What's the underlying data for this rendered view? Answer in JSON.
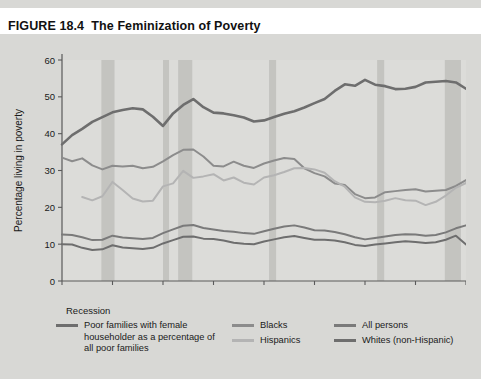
{
  "figure": {
    "number": "FIGURE 18.4",
    "title": "The Feminization of Poverty"
  },
  "legend": {
    "recession_label": "Recession",
    "entries": [
      {
        "label": "Poor families with female householder as a percentage of all poor families",
        "color": "#6e6e6e",
        "column": 1
      },
      {
        "label": "Blacks",
        "color": "#8c8c8c",
        "column": 2
      },
      {
        "label": "Hispanics",
        "color": "#b4b4b4",
        "column": 2
      },
      {
        "label": "All persons",
        "color": "#7a7a7a",
        "column": 3
      },
      {
        "label": "Whites (non-Hispanic)",
        "color": "#6e6e6e",
        "column": 3
      }
    ]
  },
  "chart_data": {
    "type": "line",
    "title": "The Feminization of Poverty",
    "xlabel": "Year",
    "ylabel": "Percentage living in poverty",
    "xlim": [
      1970,
      2010
    ],
    "ylim": [
      0,
      60
    ],
    "xticks": [
      1970,
      1975,
      1980,
      1985,
      1990,
      1995,
      2000,
      2005,
      2010
    ],
    "yticks": [
      0,
      10,
      20,
      30,
      40,
      50,
      60
    ],
    "grid": false,
    "legend_position": "below",
    "recession_bands": [
      {
        "start": 1973.9,
        "end": 1975.2
      },
      {
        "start": 1980.0,
        "end": 1980.6
      },
      {
        "start": 1981.5,
        "end": 1982.9
      },
      {
        "start": 1990.5,
        "end": 1991.2
      },
      {
        "start": 2001.2,
        "end": 2001.9
      },
      {
        "start": 2007.9,
        "end": 2009.5
      }
    ],
    "series": [
      {
        "name": "Poor families with female householder as a percentage of all poor families",
        "color": "#6e6e6e",
        "width": 2.6,
        "x": [
          1970,
          1971,
          1972,
          1973,
          1974,
          1975,
          1976,
          1977,
          1978,
          1979,
          1980,
          1981,
          1982,
          1983,
          1984,
          1985,
          1986,
          1987,
          1988,
          1989,
          1990,
          1991,
          1992,
          1993,
          1994,
          1995,
          1996,
          1997,
          1998,
          1999,
          2000,
          2001,
          2002,
          2003,
          2004,
          2005,
          2006,
          2007,
          2008,
          2009,
          2010
        ],
        "y": [
          37.1,
          39.6,
          41.3,
          43.2,
          44.5,
          45.8,
          46.4,
          46.9,
          46.6,
          44.6,
          42.1,
          45.5,
          47.8,
          49.4,
          47.2,
          45.7,
          45.5,
          45.0,
          44.4,
          43.3,
          43.6,
          44.5,
          45.4,
          46.1,
          47.1,
          48.3,
          49.4,
          51.6,
          53.4,
          53.0,
          54.6,
          53.3,
          52.9,
          52.1,
          52.2,
          52.7,
          53.9,
          54.1,
          54.3,
          53.9,
          52.2
        ]
      },
      {
        "name": "Blacks",
        "color": "#8c8c8c",
        "width": 2.0,
        "x": [
          1970,
          1971,
          1972,
          1973,
          1974,
          1975,
          1976,
          1977,
          1978,
          1979,
          1980,
          1981,
          1982,
          1983,
          1984,
          1985,
          1986,
          1987,
          1988,
          1989,
          1990,
          1991,
          1992,
          1993,
          1994,
          1995,
          1996,
          1997,
          1998,
          1999,
          2000,
          2001,
          2002,
          2003,
          2004,
          2005,
          2006,
          2007,
          2008,
          2009,
          2010
        ],
        "y": [
          33.5,
          32.5,
          33.3,
          31.4,
          30.3,
          31.3,
          31.1,
          31.3,
          30.6,
          31.0,
          32.5,
          34.2,
          35.6,
          35.7,
          33.8,
          31.3,
          31.1,
          32.4,
          31.3,
          30.7,
          31.9,
          32.7,
          33.4,
          33.1,
          30.6,
          29.3,
          28.4,
          26.5,
          26.1,
          23.6,
          22.5,
          22.7,
          24.1,
          24.4,
          24.7,
          24.9,
          24.3,
          24.5,
          24.7,
          25.8,
          27.4
        ]
      },
      {
        "name": "Hispanics",
        "color": "#b4b4b4",
        "width": 2.0,
        "x": [
          1972,
          1973,
          1974,
          1975,
          1976,
          1977,
          1978,
          1979,
          1980,
          1981,
          1982,
          1983,
          1984,
          1985,
          1986,
          1987,
          1988,
          1989,
          1990,
          1991,
          1992,
          1993,
          1994,
          1995,
          1996,
          1997,
          1998,
          1999,
          2000,
          2001,
          2002,
          2003,
          2004,
          2005,
          2006,
          2007,
          2008,
          2009,
          2010
        ],
        "y": [
          22.8,
          21.9,
          23.0,
          26.9,
          24.7,
          22.4,
          21.6,
          21.8,
          25.7,
          26.5,
          29.9,
          28.0,
          28.4,
          29.0,
          27.3,
          28.1,
          26.7,
          26.2,
          28.1,
          28.7,
          29.6,
          30.6,
          30.7,
          30.3,
          29.4,
          27.1,
          25.6,
          22.7,
          21.5,
          21.4,
          21.8,
          22.5,
          21.9,
          21.8,
          20.6,
          21.5,
          23.2,
          25.3,
          26.6
        ]
      },
      {
        "name": "All persons",
        "color": "#7a7a7a",
        "width": 2.0,
        "x": [
          1970,
          1971,
          1972,
          1973,
          1974,
          1975,
          1976,
          1977,
          1978,
          1979,
          1980,
          1981,
          1982,
          1983,
          1984,
          1985,
          1986,
          1987,
          1988,
          1989,
          1990,
          1991,
          1992,
          1993,
          1994,
          1995,
          1996,
          1997,
          1998,
          1999,
          2000,
          2001,
          2002,
          2003,
          2004,
          2005,
          2006,
          2007,
          2008,
          2009,
          2010
        ],
        "y": [
          12.6,
          12.5,
          11.9,
          11.1,
          11.2,
          12.3,
          11.8,
          11.6,
          11.4,
          11.7,
          13.0,
          14.0,
          15.0,
          15.2,
          14.4,
          14.0,
          13.6,
          13.4,
          13.0,
          12.8,
          13.5,
          14.2,
          14.8,
          15.1,
          14.5,
          13.8,
          13.7,
          13.3,
          12.7,
          11.9,
          11.3,
          11.7,
          12.1,
          12.5,
          12.7,
          12.6,
          12.3,
          12.5,
          13.2,
          14.3,
          15.1
        ]
      },
      {
        "name": "Whites (non-Hispanic)",
        "color": "#6e6e6e",
        "width": 2.0,
        "x": [
          1970,
          1971,
          1972,
          1973,
          1974,
          1975,
          1976,
          1977,
          1978,
          1979,
          1980,
          1981,
          1982,
          1983,
          1984,
          1985,
          1986,
          1987,
          1988,
          1989,
          1990,
          1991,
          1992,
          1993,
          1994,
          1995,
          1996,
          1997,
          1998,
          1999,
          2000,
          2001,
          2002,
          2003,
          2004,
          2005,
          2006,
          2007,
          2008,
          2009,
          2010
        ],
        "y": [
          10.0,
          9.9,
          9.0,
          8.4,
          8.6,
          9.7,
          9.1,
          8.9,
          8.7,
          9.0,
          10.2,
          11.1,
          12.0,
          12.1,
          11.5,
          11.4,
          11.0,
          10.4,
          10.1,
          10.0,
          10.7,
          11.3,
          11.9,
          12.2,
          11.7,
          11.2,
          11.2,
          11.0,
          10.5,
          9.8,
          9.5,
          9.9,
          10.2,
          10.5,
          10.8,
          10.6,
          10.3,
          10.5,
          11.2,
          12.3,
          9.9
        ]
      }
    ]
  }
}
